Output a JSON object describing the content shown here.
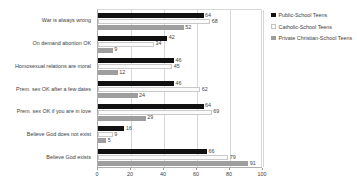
{
  "chart_data": {
    "type": "bar",
    "orientation": "horizontal",
    "title": "",
    "xlabel": "",
    "ylabel": "",
    "xlim": [
      0,
      100
    ],
    "xticks": [
      0,
      20,
      40,
      60,
      80,
      100
    ],
    "grid": true,
    "legend_position": "right",
    "categories": [
      "War is always wrong",
      "On demand abortion OK",
      "Homosexual relations are moral",
      "Prem. sex OK after a few dates",
      "Prem. sex OK if you are in love",
      "Believe God does not exist",
      "Believe God exists"
    ],
    "series": [
      {
        "name": "Public-School Teens",
        "color": "#111111",
        "values": [
          64,
          42,
          46,
          46,
          64,
          16,
          66
        ]
      },
      {
        "name": "Catholic-School Teens",
        "color": "#fbfbfb",
        "values": [
          68,
          34,
          45,
          62,
          69,
          9,
          79
        ]
      },
      {
        "name": "Private Christian-School Teens",
        "color": "#9e9e9e",
        "values": [
          52,
          9,
          12,
          24,
          29,
          5,
          91
        ]
      }
    ]
  }
}
